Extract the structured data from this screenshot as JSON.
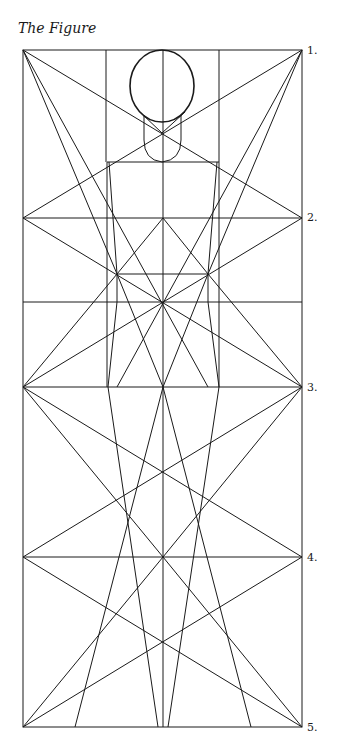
{
  "title": "The Figure",
  "row_labels": [
    {
      "label": "1.",
      "x": 307,
      "y": 45
    },
    {
      "label": "2.",
      "x": 307,
      "y": 212
    },
    {
      "label": "3.",
      "x": 307,
      "y": 382
    },
    {
      "label": "4.",
      "x": 307,
      "y": 552
    },
    {
      "label": "5.",
      "x": 307,
      "y": 722
    }
  ],
  "colors": {
    "line": "#1a1a1a",
    "background": "#ffffff"
  }
}
